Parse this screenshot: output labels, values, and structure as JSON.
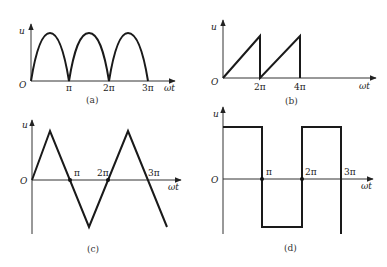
{
  "figure": {
    "panels": [
      {
        "id": "a",
        "caption": "(a)",
        "y_label": "u",
        "x_label": "ωt",
        "origin_label": "O",
        "waveform": "full-wave rectified sine",
        "ticks": [
          "π",
          "2π",
          "3π"
        ]
      },
      {
        "id": "b",
        "caption": "(b)",
        "y_label": "u",
        "x_label": "ωt",
        "origin_label": "O",
        "waveform": "sawtooth",
        "ticks": [
          "2π",
          "4π"
        ]
      },
      {
        "id": "c",
        "caption": "(c)",
        "y_label": "u",
        "x_label": "ωt",
        "origin_label": "O",
        "waveform": "triangle",
        "ticks": [
          "π",
          "2π",
          "3π"
        ]
      },
      {
        "id": "d",
        "caption": "(d)",
        "y_label": "u",
        "x_label": "ωt",
        "origin_label": "O",
        "waveform": "square",
        "ticks": [
          "π",
          "2π",
          "3π"
        ]
      }
    ]
  }
}
